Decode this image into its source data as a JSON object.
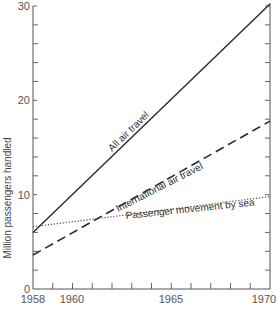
{
  "chart_data": {
    "type": "line",
    "title": "",
    "xlabel": "",
    "ylabel": "Million passengers handled",
    "xlim": [
      1958,
      1970
    ],
    "ylim": [
      0,
      30
    ],
    "x_ticks": [
      1958,
      1959,
      1960,
      1961,
      1962,
      1963,
      1964,
      1965,
      1966,
      1967,
      1968,
      1969,
      1970
    ],
    "x_tick_labels": [
      "1958",
      "1960",
      "1965",
      "1970"
    ],
    "y_ticks": [
      0,
      2,
      4,
      6,
      8,
      10,
      12,
      14,
      16,
      18,
      20,
      22,
      24,
      26,
      28,
      30
    ],
    "y_tick_labels": [
      "0",
      "10",
      "20",
      "30"
    ],
    "grid": false,
    "legend": "inline labels",
    "series": [
      {
        "name": "All air travel",
        "style": "solid",
        "x": [
          1958,
          1970
        ],
        "values": [
          6.0,
          30.2
        ]
      },
      {
        "name": "International air travel",
        "style": "dashed",
        "x": [
          1958,
          1970
        ],
        "values": [
          3.6,
          17.8
        ]
      },
      {
        "name": "Passenger movement by sea",
        "style": "dotted",
        "x": [
          1958,
          1970
        ],
        "values": [
          6.6,
          9.8
        ]
      }
    ]
  },
  "labels": {
    "ylabel": "Million passengers handled",
    "y0": "0",
    "y10": "10",
    "y20": "20",
    "y30": "30",
    "x1958": "1958",
    "x1960": "1960",
    "x1965": "1965",
    "x1970": "1970",
    "all_air": "All air travel",
    "intl_air": "International air travel",
    "sea": "Passenger movement by sea"
  },
  "colors": {
    "line": "#2a2a2a",
    "axis": "#555555"
  }
}
